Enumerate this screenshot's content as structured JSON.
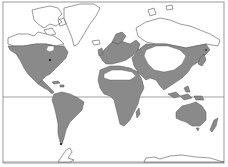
{
  "map": {
    "type": "world-distribution-map",
    "projection": "mercator",
    "colors": {
      "background": "#ffffff",
      "land_outline": "#555555",
      "shaded_region": "#8a8a8a",
      "frame": "#999999",
      "equator_line": "#888888"
    },
    "frame": {
      "left": 3,
      "top": 2,
      "right": 224,
      "bottom": 163
    },
    "equator_y": 97,
    "antarctic_baseline_y": 162,
    "shaded_regions": [
      "north-america-temperate",
      "central-america",
      "south-america",
      "europe",
      "africa-sub-saharan-and-north-coast",
      "middle-east",
      "asia-south-and-east",
      "siberia-southern-belt",
      "southeast-asia-islands",
      "japan",
      "australia",
      "new-zealand",
      "madagascar"
    ],
    "unshaded_regions": [
      "arctic-canada",
      "greenland",
      "sahara",
      "central-asia-interior",
      "arctic-russia",
      "antarctica"
    ]
  }
}
